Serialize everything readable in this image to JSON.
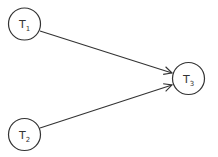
{
  "diagram": {
    "type": "directed-graph",
    "nodes": [
      {
        "id": "T1",
        "label": "T",
        "subscript": "1",
        "cx": 24.5,
        "cy": 24,
        "r": 16
      },
      {
        "id": "T2",
        "label": "T",
        "subscript": "2",
        "cx": 24.5,
        "cy": 134.5,
        "r": 16
      },
      {
        "id": "T3",
        "label": "T",
        "subscript": "3",
        "cx": 188.5,
        "cy": 78.5,
        "r": 16
      }
    ],
    "edges": [
      {
        "from": "T1",
        "to": "T3"
      },
      {
        "from": "T2",
        "to": "T3"
      }
    ],
    "colors": {
      "stroke": "#333333",
      "background": "#ffffff"
    }
  }
}
